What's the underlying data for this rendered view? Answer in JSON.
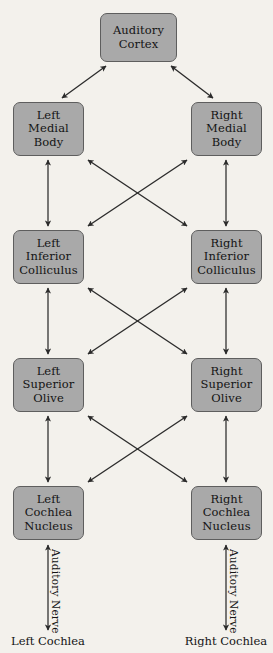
{
  "diagram": {
    "background_color": "#f3f1ec",
    "node_fill_color": "#a9a9a9",
    "node_border_color": "#5e5e5e",
    "arrow_color": "#2b2b2b",
    "nodes": [
      {
        "id": "auditory-cortex",
        "lines": [
          "Auditory",
          "Cortex"
        ],
        "x": 100,
        "y": 13,
        "w": 77,
        "h": 49
      },
      {
        "id": "left-medial-body",
        "lines": [
          "Left",
          "Medial",
          "Body"
        ],
        "x": 13,
        "y": 102,
        "w": 71,
        "h": 54
      },
      {
        "id": "right-medial-body",
        "lines": [
          "Right",
          "Medial",
          "Body"
        ],
        "x": 191,
        "y": 102,
        "w": 71,
        "h": 54
      },
      {
        "id": "left-inferior-colliculus",
        "lines": [
          "Left",
          "Inferior",
          "Colliculus"
        ],
        "x": 13,
        "y": 230,
        "w": 71,
        "h": 54
      },
      {
        "id": "right-inferior-colliculus",
        "lines": [
          "Right",
          "Inferior",
          "Colliculus"
        ],
        "x": 191,
        "y": 230,
        "w": 71,
        "h": 54
      },
      {
        "id": "left-superior-olive",
        "lines": [
          "Left",
          "Superior",
          "Olive"
        ],
        "x": 13,
        "y": 358,
        "w": 71,
        "h": 54
      },
      {
        "id": "right-superior-olive",
        "lines": [
          "Right",
          "Superior",
          "Olive"
        ],
        "x": 191,
        "y": 358,
        "w": 71,
        "h": 54
      },
      {
        "id": "left-cochlea-nucleus",
        "lines": [
          "Left",
          "Cochlea",
          "Nucleus"
        ],
        "x": 13,
        "y": 486,
        "w": 71,
        "h": 54
      },
      {
        "id": "right-cochlea-nucleus",
        "lines": [
          "Right",
          "Cochlea",
          "Nucleus"
        ],
        "x": 191,
        "y": 486,
        "w": 71,
        "h": 54
      }
    ],
    "nerve_labels": [
      {
        "id": "left-auditory-nerve",
        "text": "Auditory Nerve"
      },
      {
        "id": "right-auditory-nerve",
        "text": "Auditory Nerve"
      }
    ],
    "endpoint_labels": [
      {
        "id": "left-cochlea",
        "text": "Left Cochlea"
      },
      {
        "id": "right-cochlea",
        "text": "Right Cochlea"
      }
    ],
    "edges": [
      {
        "from": "left-medial-body",
        "to": "auditory-cortex",
        "style": "double-arrow",
        "kind": "diagonal"
      },
      {
        "from": "right-medial-body",
        "to": "auditory-cortex",
        "style": "double-arrow",
        "kind": "diagonal"
      },
      {
        "from": "left-inferior-colliculus",
        "to": "left-medial-body",
        "style": "double-arrow",
        "kind": "vertical"
      },
      {
        "from": "right-inferior-colliculus",
        "to": "right-medial-body",
        "style": "double-arrow",
        "kind": "vertical"
      },
      {
        "from": "left-inferior-colliculus",
        "to": "right-medial-body",
        "style": "double-arrow",
        "kind": "crossing"
      },
      {
        "from": "right-inferior-colliculus",
        "to": "left-medial-body",
        "style": "double-arrow",
        "kind": "crossing"
      },
      {
        "from": "left-superior-olive",
        "to": "left-inferior-colliculus",
        "style": "double-arrow",
        "kind": "vertical"
      },
      {
        "from": "right-superior-olive",
        "to": "right-inferior-colliculus",
        "style": "double-arrow",
        "kind": "vertical"
      },
      {
        "from": "left-superior-olive",
        "to": "right-inferior-colliculus",
        "style": "double-arrow",
        "kind": "crossing"
      },
      {
        "from": "right-superior-olive",
        "to": "left-inferior-colliculus",
        "style": "double-arrow",
        "kind": "crossing"
      },
      {
        "from": "left-cochlea-nucleus",
        "to": "left-superior-olive",
        "style": "double-arrow",
        "kind": "vertical"
      },
      {
        "from": "right-cochlea-nucleus",
        "to": "right-superior-olive",
        "style": "double-arrow",
        "kind": "vertical"
      },
      {
        "from": "left-cochlea-nucleus",
        "to": "right-superior-olive",
        "style": "double-arrow",
        "kind": "crossing"
      },
      {
        "from": "right-cochlea-nucleus",
        "to": "left-superior-olive",
        "style": "double-arrow",
        "kind": "crossing"
      },
      {
        "from": "left-cochlea",
        "to": "left-cochlea-nucleus",
        "style": "double-arrow",
        "kind": "vertical"
      },
      {
        "from": "right-cochlea",
        "to": "right-cochlea-nucleus",
        "style": "double-arrow",
        "kind": "vertical"
      }
    ]
  }
}
